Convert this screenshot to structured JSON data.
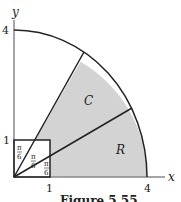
{
  "figure": {
    "caption": "Figure 5.55",
    "axes": {
      "x_label": "x",
      "y_label": "y",
      "x_ticks": [
        "1",
        "4"
      ],
      "y_ticks": [
        "1",
        "4"
      ]
    },
    "regions": {
      "upper": "C",
      "lower": "R"
    },
    "angles": [
      "π/6",
      "π/6",
      "π/6"
    ],
    "angle_num": "π",
    "angle_den": "6",
    "colors": {
      "shade": "#d3d3d3",
      "line": "#222222",
      "axis": "#888888"
    }
  }
}
